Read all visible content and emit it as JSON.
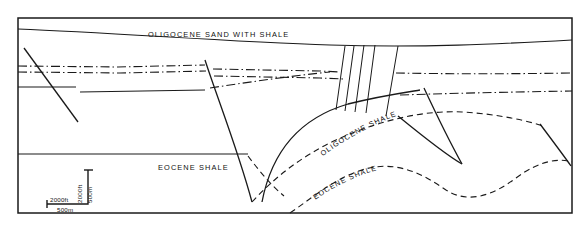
{
  "figure": {
    "type": "geological-cross-section",
    "background_color": "#ffffff",
    "line_color": "#1a1a1a",
    "frame": {
      "x": 18,
      "y": 18,
      "width": 554,
      "height": 195
    }
  },
  "labels": {
    "oligocene_sand_with_shale": "OLIGOCENE  SAND  WITH  SHALE",
    "eocene_shale_left": "EOCENE  SHALE",
    "oligocene_shale_curve": "OLIGOCENE SHALE",
    "eocene_shale_curve": "EOCENE  SHALE"
  },
  "scale_bar": {
    "horizontal_top": "2000ft",
    "horizontal_bottom": "500m",
    "vertical_left": "2000ft",
    "vertical_right": "500m"
  },
  "units": [
    {
      "name": "OLIGOCENE SAND WITH SHALE",
      "position": "upper"
    },
    {
      "name": "OLIGOCENE SHALE",
      "position": "middle"
    },
    {
      "name": "EOCENE SHALE",
      "position": "lower"
    }
  ],
  "features": {
    "fault_count": 10,
    "fault_style": "normal-listric",
    "marker_bed_style": "dash-dot",
    "inferred_horizon_style": "dashed"
  }
}
